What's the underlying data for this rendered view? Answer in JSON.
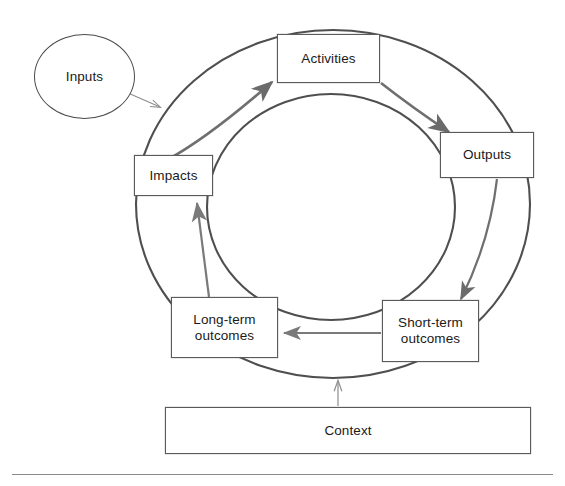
{
  "diagram": {
    "type": "cyclical-logic-model",
    "title": "",
    "background_color": "#ffffff",
    "stroke_color": "#4a4a4a",
    "arrow_color": "#6b6b6b",
    "text_color": "#1a1a1a",
    "nodes": [
      {
        "id": "inputs",
        "label": "Inputs",
        "shape": "ellipse",
        "x": 34,
        "y": 34,
        "w": 101,
        "h": 85
      },
      {
        "id": "activities",
        "label": "Activities",
        "shape": "rect",
        "x": 277,
        "y": 34,
        "w": 103,
        "h": 49
      },
      {
        "id": "outputs",
        "label": "Outputs",
        "shape": "rect",
        "x": 440,
        "y": 132,
        "w": 94,
        "h": 46
      },
      {
        "id": "short-term-outcomes",
        "label": "Short-term\noutcomes",
        "shape": "rect",
        "x": 382,
        "y": 300,
        "w": 97,
        "h": 62
      },
      {
        "id": "long-term-outcomes",
        "label": "Long-term\noutcomes",
        "shape": "rect",
        "x": 171,
        "y": 297,
        "w": 107,
        "h": 61
      },
      {
        "id": "impacts",
        "label": "Impacts",
        "shape": "rect",
        "x": 134,
        "y": 155,
        "w": 79,
        "h": 41
      },
      {
        "id": "context",
        "label": "Context",
        "shape": "rect",
        "x": 165,
        "y": 407,
        "w": 366,
        "h": 47
      }
    ],
    "edges": [
      {
        "id": "inputs-to-ring",
        "from": "inputs",
        "to": "outer-ring",
        "style": "thin-straight"
      },
      {
        "id": "impacts-to-activities",
        "from": "impacts",
        "to": "activities",
        "style": "thick-curve"
      },
      {
        "id": "activities-to-outputs",
        "from": "activities",
        "to": "outputs",
        "style": "thick-curve"
      },
      {
        "id": "outputs-to-short-term",
        "from": "outputs",
        "to": "short-term-outcomes",
        "style": "thick-curve"
      },
      {
        "id": "short-term-to-long-term",
        "from": "short-term-outcomes",
        "to": "long-term-outcomes",
        "style": "straight"
      },
      {
        "id": "long-term-to-impacts",
        "from": "long-term-outcomes",
        "to": "impacts",
        "style": "straight"
      },
      {
        "id": "context-to-ring",
        "from": "context",
        "to": "outer-ring",
        "style": "thin-straight"
      }
    ],
    "ring": {
      "outer": {
        "cx": 333,
        "cy": 204,
        "rx": 197,
        "ry": 174
      },
      "inner": {
        "cx": 331,
        "cy": 207,
        "rx": 124,
        "ry": 113
      }
    },
    "footer_rule": {
      "x": 12,
      "y": 474,
      "w": 541
    }
  }
}
